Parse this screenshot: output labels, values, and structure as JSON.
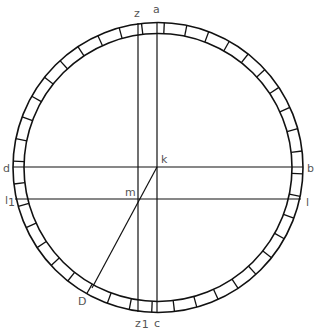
{
  "diagram": {
    "type": "geometric-construction",
    "colors": {
      "stroke": "#111111",
      "label": "#555555",
      "background": "#ffffff"
    },
    "circle": {
      "center": [
        157.5,
        167.5
      ],
      "outer_radius": 145,
      "inner_radius": 134,
      "ring_divisions": 40
    },
    "lines": [
      {
        "name": "vertical-a-c",
        "from": "a",
        "to": "c",
        "x": 157
      },
      {
        "name": "vertical-z-z1",
        "from": "z",
        "to": "z1",
        "x": 138
      },
      {
        "name": "horizontal-d-b",
        "from": "d",
        "to": "b",
        "y": 167
      },
      {
        "name": "horizontal-l1-l",
        "from": "l1",
        "to": "l",
        "y": 199
      },
      {
        "name": "diagonal-k-D",
        "from": "k",
        "to": "D",
        "through": "m"
      }
    ],
    "labels": {
      "a": "a",
      "z": "z",
      "c": "c",
      "z1_main": "z",
      "z1_sub": "1",
      "d": "d",
      "b": "b",
      "l1_main": "l",
      "l1_sub": "1",
      "l": "l",
      "k": "k",
      "m": "m",
      "D": "D"
    }
  }
}
